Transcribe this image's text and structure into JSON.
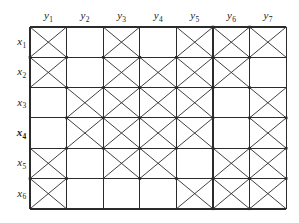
{
  "figure": {
    "type": "grid-diagram",
    "rows": 6,
    "cols": 7,
    "line_color": "#2b2b2b",
    "background_color": "#ffffff"
  },
  "column_headers": [
    {
      "label": "y",
      "subscript": "1"
    },
    {
      "label": "y",
      "subscript": "2"
    },
    {
      "label": "y",
      "subscript": "3"
    },
    {
      "label": "y",
      "subscript": "4"
    },
    {
      "label": "y",
      "subscript": "5"
    },
    {
      "label": "y",
      "subscript": "6"
    },
    {
      "label": "y",
      "subscript": "7"
    }
  ],
  "row_headers": [
    {
      "label": "x",
      "subscript": "1",
      "emphasized": false
    },
    {
      "label": "x",
      "subscript": "2",
      "emphasized": false
    },
    {
      "label": "x",
      "subscript": "3",
      "emphasized": false
    },
    {
      "label": "x",
      "subscript": "4",
      "emphasized": true
    },
    {
      "label": "x",
      "subscript": "5",
      "emphasized": false
    },
    {
      "label": "x",
      "subscript": "6",
      "emphasized": false
    }
  ],
  "chart_data": {
    "type": "heatmap",
    "title": "",
    "xlabel": "",
    "ylabel": "",
    "categories": [
      "y1",
      "y2",
      "y3",
      "y4",
      "y5",
      "y6",
      "y7"
    ],
    "row_categories": [
      "x1",
      "x2",
      "x3",
      "x4",
      "x5",
      "x6"
    ],
    "legend": [],
    "grid": true,
    "note": "1 = cell marked with an X (crossed diagonals), 0 = empty cell",
    "matrix": [
      [
        1,
        0,
        1,
        0,
        1,
        1,
        1
      ],
      [
        1,
        0,
        1,
        1,
        1,
        1,
        0
      ],
      [
        0,
        1,
        1,
        1,
        1,
        0,
        1
      ],
      [
        0,
        1,
        1,
        1,
        1,
        0,
        1
      ],
      [
        1,
        0,
        1,
        1,
        0,
        1,
        1
      ],
      [
        1,
        0,
        0,
        0,
        1,
        1,
        1
      ]
    ]
  },
  "geometry": {
    "grid_left": 30,
    "grid_top": 27,
    "cell_width": 36.6,
    "cell_height": 30.3
  }
}
